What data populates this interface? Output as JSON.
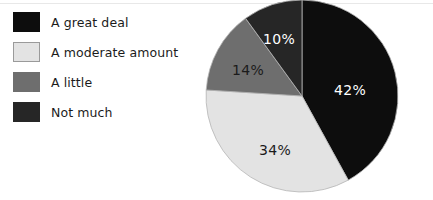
{
  "chart_data": {
    "type": "pie",
    "title": "",
    "categories": [
      "A great deal",
      "A moderate amount",
      "A little",
      "Not much"
    ],
    "values": [
      42,
      34,
      14,
      10
    ],
    "value_labels": [
      "42%",
      "34%",
      "14%",
      "10%"
    ],
    "colors": [
      "#0d0d0d",
      "#e3e3e3",
      "#6e6e6e",
      "#262626"
    ],
    "label_colors": [
      "#ffffff",
      "#1b1b1b",
      "#1b1b1b",
      "#ffffff"
    ],
    "start_angle_deg": 0,
    "direction": "clockwise",
    "legend_position": "left",
    "grid": false,
    "xlabel": "",
    "ylabel": ""
  },
  "legend": {
    "items": [
      {
        "label": "A great deal",
        "color": "#0d0d0d",
        "border": "#0d0d0d"
      },
      {
        "label": "A moderate amount",
        "color": "#e3e3e3",
        "border": "#9a9a9a"
      },
      {
        "label": "A little",
        "color": "#6e6e6e",
        "border": "#6e6e6e"
      },
      {
        "label": "Not much",
        "color": "#262626",
        "border": "#262626"
      }
    ]
  },
  "pie": {
    "center_x": 302,
    "center_y": 96,
    "radius": 96,
    "slices": [
      {
        "name": "A great deal",
        "percent": 42,
        "label": "42%",
        "fill": "#0d0d0d",
        "label_color": "#ffffff",
        "label_x": 350,
        "label_y": 90
      },
      {
        "name": "A moderate amount",
        "percent": 34,
        "label": "34%",
        "fill": "#e3e3e3",
        "label_color": "#1b1b1b",
        "label_x": 275,
        "label_y": 150
      },
      {
        "name": "A little",
        "percent": 14,
        "label": "14%",
        "fill": "#6e6e6e",
        "label_color": "#1b1b1b",
        "label_x": 248,
        "label_y": 70
      },
      {
        "name": "Not much",
        "percent": 10,
        "label": "10%",
        "fill": "#262626",
        "label_color": "#ffffff",
        "label_x": 279,
        "label_y": 39
      }
    ]
  }
}
